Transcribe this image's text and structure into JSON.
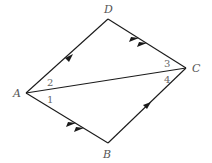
{
  "diagram": {
    "type": "geometry-quadrilateral",
    "vertices": {
      "A": {
        "label": "A",
        "x": 26,
        "y": 93
      },
      "B": {
        "label": "B",
        "x": 108,
        "y": 143
      },
      "C": {
        "label": "C",
        "x": 186,
        "y": 68
      },
      "D": {
        "label": "D",
        "x": 108,
        "y": 19
      }
    },
    "edges": [
      {
        "from": "A",
        "to": "D",
        "arrows": 1
      },
      {
        "from": "D",
        "to": "C",
        "arrows": 2
      },
      {
        "from": "A",
        "to": "B",
        "arrows": 2
      },
      {
        "from": "B",
        "to": "C",
        "arrows": 1
      },
      {
        "from": "A",
        "to": "C",
        "arrows": 0,
        "role": "diagonal"
      }
    ],
    "angle_labels": {
      "a1": "1",
      "a2": "2",
      "a3": "3",
      "a4": "4"
    },
    "colors": {
      "line": "#1a1a1a",
      "vertex_label": "#555555",
      "angle_label": "#666666",
      "background": "#ffffff"
    }
  }
}
